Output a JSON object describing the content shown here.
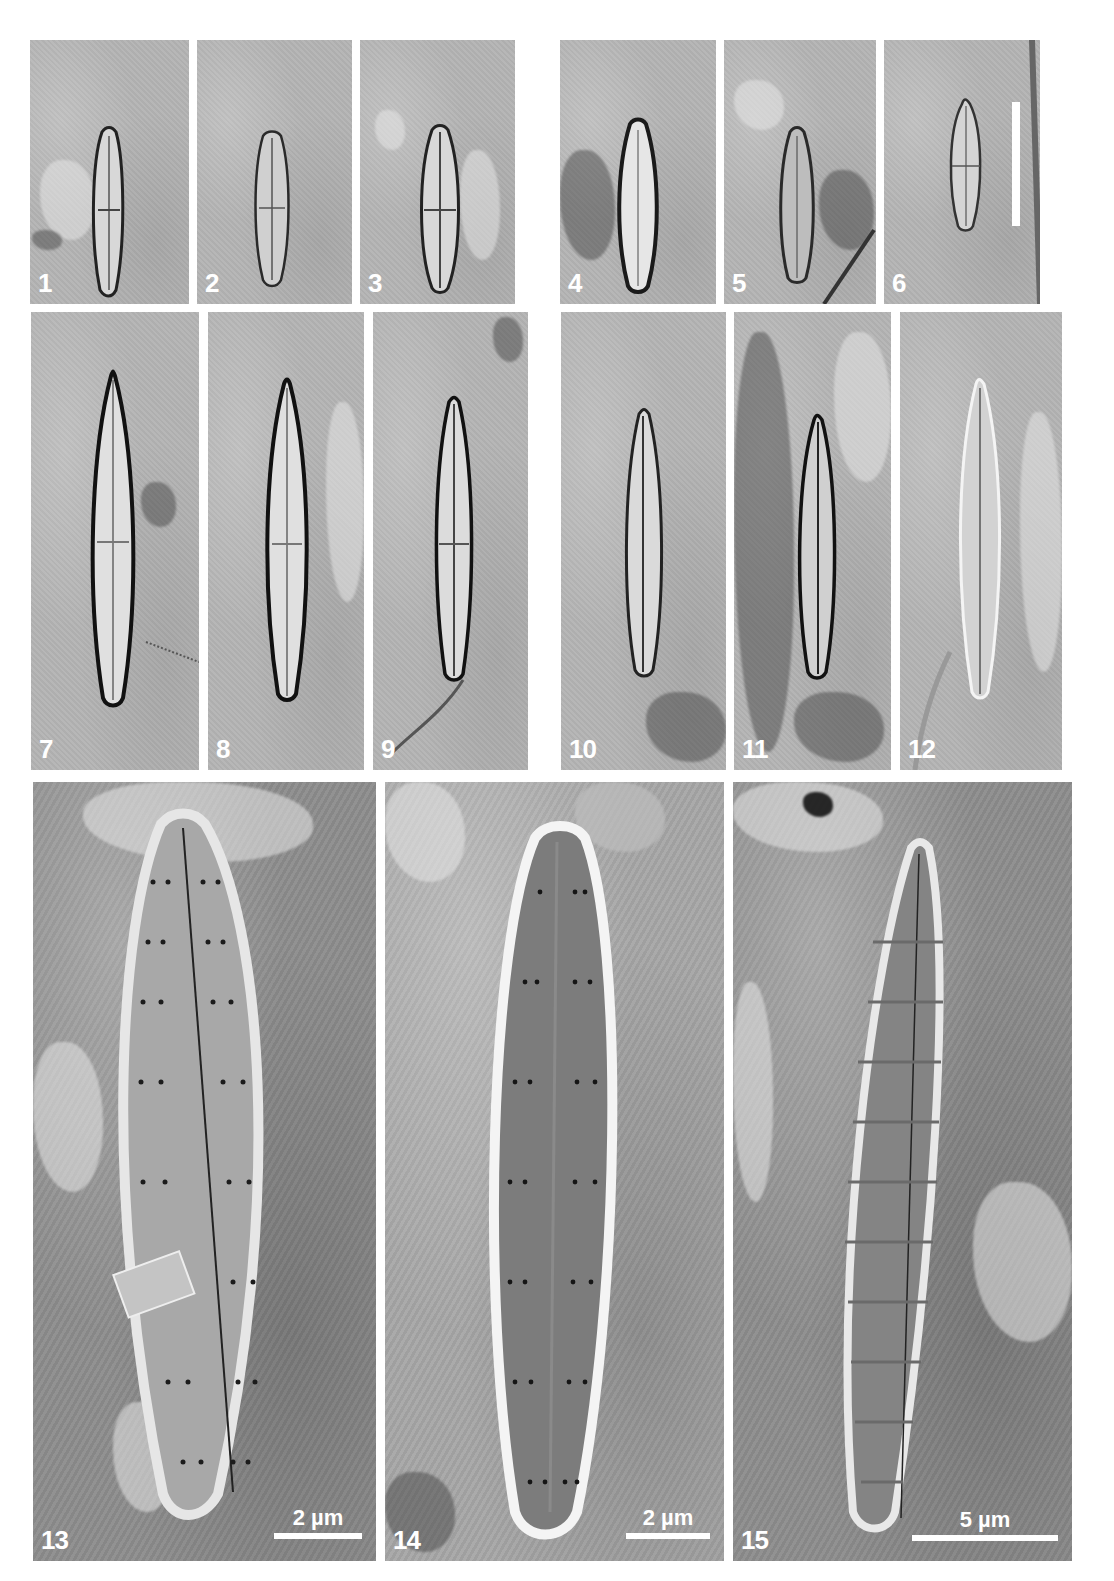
{
  "figure": {
    "colors": {
      "background": "#ffffff",
      "lm_panel": "#b4b4b4",
      "sem_panel": "#8c8c8c",
      "label": "#ffffff"
    },
    "panels": [
      {
        "label": "1",
        "type": "LM"
      },
      {
        "label": "2",
        "type": "LM"
      },
      {
        "label": "3",
        "type": "LM"
      },
      {
        "label": "4",
        "type": "LM"
      },
      {
        "label": "5",
        "type": "LM"
      },
      {
        "label": "6",
        "type": "LM",
        "has_scale_bar": true
      },
      {
        "label": "7",
        "type": "LM"
      },
      {
        "label": "8",
        "type": "LM"
      },
      {
        "label": "9",
        "type": "LM"
      },
      {
        "label": "10",
        "type": "LM"
      },
      {
        "label": "11",
        "type": "LM"
      },
      {
        "label": "12",
        "type": "LM"
      },
      {
        "label": "13",
        "type": "SEM",
        "scale_bar": "2 µm"
      },
      {
        "label": "14",
        "type": "SEM",
        "scale_bar": "2 µm"
      },
      {
        "label": "15",
        "type": "SEM",
        "scale_bar": "5 µm"
      }
    ]
  }
}
